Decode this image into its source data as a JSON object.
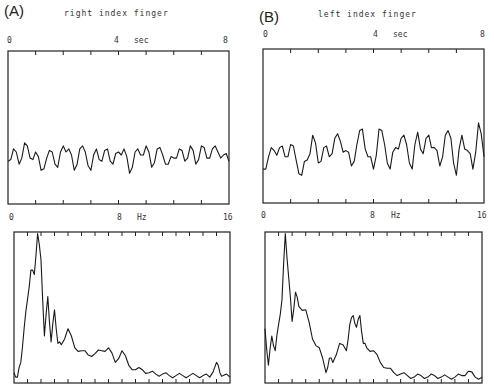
{
  "figure": {
    "panels": [
      {
        "id": "A",
        "label": "(A)",
        "title": "right index finger",
        "time_axis": {
          "start": "0",
          "mid": "4",
          "unit": "sec",
          "end": "8"
        },
        "freq_axis": {
          "start": "0",
          "mid": "8",
          "unit": "Hz",
          "end": "16"
        }
      },
      {
        "id": "B",
        "label": "(B)",
        "title": "left index finger",
        "time_axis": {
          "start": "0",
          "mid": "4",
          "unit": "sec",
          "end": "8"
        },
        "freq_axis": {
          "start": "0",
          "mid": "8",
          "unit": "Hz",
          "end": "16"
        }
      }
    ]
  },
  "chart_data": [
    {
      "type": "line",
      "title": "right index finger — time series",
      "panel": "A",
      "xlabel": "sec",
      "xlim": [
        0,
        8
      ],
      "x_ticks": [
        0,
        1,
        2,
        3,
        4,
        5,
        6,
        7,
        8
      ],
      "x_tick_labels": [
        "0",
        "4",
        "8"
      ],
      "ylabel": "",
      "description": "Low-amplitude irregular tremor oscillation centered near lower third of box",
      "x": [
        0,
        0.2,
        0.4,
        0.6,
        0.8,
        1.0,
        1.2,
        1.4,
        1.6,
        1.8,
        2.0,
        2.2,
        2.4,
        2.6,
        2.8,
        3.0,
        3.2,
        3.4,
        3.6,
        3.8,
        4.0,
        4.2,
        4.4,
        4.6,
        4.8,
        5.0,
        5.2,
        5.4,
        5.6,
        5.8,
        6.0,
        6.2,
        6.4,
        6.6,
        6.8,
        7.0,
        7.2,
        7.4,
        7.6,
        7.8,
        8.0
      ],
      "y": [
        0.28,
        0.36,
        0.26,
        0.4,
        0.3,
        0.34,
        0.22,
        0.3,
        0.34,
        0.24,
        0.38,
        0.36,
        0.22,
        0.36,
        0.34,
        0.22,
        0.36,
        0.28,
        0.36,
        0.26,
        0.34,
        0.36,
        0.2,
        0.34,
        0.32,
        0.38,
        0.24,
        0.36,
        0.32,
        0.26,
        0.3,
        0.36,
        0.28,
        0.38,
        0.26,
        0.38,
        0.3,
        0.36,
        0.34,
        0.32,
        0.28
      ],
      "grid": false
    },
    {
      "type": "line",
      "title": "right index finger — power spectrum",
      "panel": "A",
      "xlabel": "Hz",
      "xlim": [
        0,
        16
      ],
      "x_ticks": [
        0,
        1,
        2,
        3,
        4,
        5,
        6,
        7,
        8,
        9,
        10,
        11,
        12,
        13,
        14,
        15,
        16
      ],
      "x_tick_labels": [
        "0",
        "8",
        "16"
      ],
      "ylabel": "",
      "description": "Dominant peak near 1.7 Hz, secondary peaks ~2-3 Hz, decaying tail, small peak near 15 Hz",
      "x": [
        0,
        0.25,
        0.5,
        0.75,
        1.0,
        1.25,
        1.5,
        1.75,
        2.0,
        2.25,
        2.5,
        2.75,
        3.0,
        3.25,
        3.5,
        4.0,
        4.5,
        5.0,
        5.5,
        6.0,
        6.5,
        7.0,
        7.5,
        8.0,
        8.5,
        9.0,
        9.5,
        10.0,
        10.5,
        11.0,
        11.5,
        12.0,
        12.5,
        13.0,
        13.5,
        14.0,
        14.5,
        15.0,
        15.25,
        15.5,
        16.0
      ],
      "y": [
        0.05,
        0.02,
        0.12,
        0.35,
        0.55,
        0.75,
        0.72,
        1.0,
        0.82,
        0.3,
        0.57,
        0.26,
        0.48,
        0.25,
        0.24,
        0.35,
        0.22,
        0.2,
        0.17,
        0.18,
        0.2,
        0.22,
        0.12,
        0.2,
        0.1,
        0.07,
        0.07,
        0.05,
        0.04,
        0.04,
        0.03,
        0.03,
        0.03,
        0.03,
        0.03,
        0.03,
        0.02,
        0.12,
        0.05,
        0.03,
        0.02
      ],
      "grid": false
    },
    {
      "type": "line",
      "title": "left index finger — time series",
      "panel": "B",
      "xlabel": "sec",
      "xlim": [
        0,
        8
      ],
      "x_ticks": [
        0,
        1,
        2,
        3,
        4,
        5,
        6,
        7,
        8
      ],
      "x_tick_labels": [
        "0",
        "4",
        "8"
      ],
      "ylabel": "",
      "description": "Larger-amplitude irregular tremor oscillation",
      "x": [
        0,
        0.2,
        0.4,
        0.6,
        0.8,
        1.0,
        1.2,
        1.4,
        1.6,
        1.8,
        2.0,
        2.2,
        2.4,
        2.6,
        2.8,
        3.0,
        3.2,
        3.4,
        3.6,
        3.8,
        4.0,
        4.2,
        4.4,
        4.6,
        4.8,
        5.0,
        5.2,
        5.4,
        5.6,
        5.8,
        6.0,
        6.2,
        6.4,
        6.6,
        6.8,
        7.0,
        7.2,
        7.4,
        7.6,
        7.8,
        8.0
      ],
      "y": [
        0.22,
        0.3,
        0.34,
        0.36,
        0.3,
        0.38,
        0.28,
        0.18,
        0.28,
        0.44,
        0.26,
        0.36,
        0.3,
        0.42,
        0.4,
        0.34,
        0.24,
        0.38,
        0.48,
        0.3,
        0.22,
        0.48,
        0.38,
        0.22,
        0.36,
        0.42,
        0.38,
        0.22,
        0.46,
        0.32,
        0.44,
        0.36,
        0.24,
        0.44,
        0.42,
        0.18,
        0.44,
        0.34,
        0.22,
        0.52,
        0.3
      ],
      "grid": false
    },
    {
      "type": "line",
      "title": "left index finger — power spectrum",
      "panel": "B",
      "xlabel": "Hz",
      "xlim": [
        0,
        16
      ],
      "x_ticks": [
        0,
        1,
        2,
        3,
        4,
        5,
        6,
        7,
        8,
        9,
        10,
        11,
        12,
        13,
        14,
        15,
        16
      ],
      "x_tick_labels": [
        "0",
        "8",
        "16"
      ],
      "ylabel": "",
      "description": "Dominant peak near 1.5 Hz, secondary peak ~7 Hz, low tail above 10 Hz",
      "x": [
        0,
        0.25,
        0.5,
        0.75,
        1.0,
        1.25,
        1.5,
        1.75,
        2.0,
        2.25,
        2.5,
        3.0,
        3.5,
        4.0,
        4.5,
        4.75,
        5.0,
        5.5,
        6.0,
        6.25,
        6.5,
        6.75,
        7.0,
        7.25,
        7.5,
        8.0,
        8.5,
        9.0,
        9.5,
        10.0,
        10.5,
        11.0,
        11.5,
        12.0,
        12.5,
        13.0,
        13.5,
        14.0,
        14.5,
        15.0,
        15.5,
        16.0
      ],
      "y": [
        0.35,
        0.1,
        0.3,
        0.2,
        0.38,
        0.55,
        1.0,
        0.7,
        0.4,
        0.6,
        0.5,
        0.48,
        0.28,
        0.22,
        0.05,
        0.15,
        0.12,
        0.25,
        0.2,
        0.38,
        0.44,
        0.36,
        0.44,
        0.25,
        0.22,
        0.2,
        0.12,
        0.08,
        0.05,
        0.04,
        0.03,
        0.02,
        0.03,
        0.02,
        0.03,
        0.02,
        0.02,
        0.02,
        0.03,
        0.06,
        0.02,
        0.02
      ],
      "grid": false
    }
  ]
}
